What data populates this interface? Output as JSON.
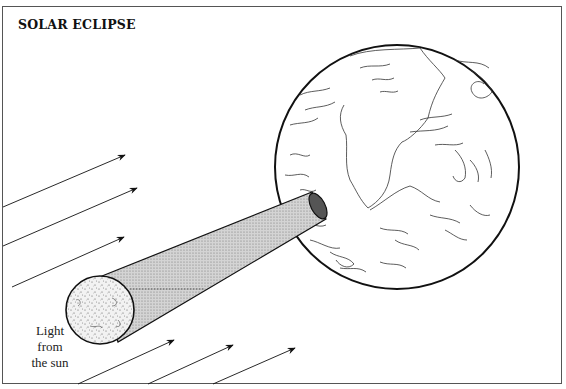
{
  "diagram": {
    "title": "SOLAR ECLIPSE",
    "label_lines": [
      "Light",
      "from",
      "the sun"
    ],
    "colors": {
      "ink": "#111111",
      "frame": "#555555",
      "shadow_fill": "#bdbdbd",
      "moon_fill": "#e6e6e6",
      "umbra_tip": "#555555",
      "background": "#ffffff"
    },
    "elements": {
      "earth": {
        "cx": 397,
        "cy": 167,
        "r": 122
      },
      "moon": {
        "cx": 100,
        "cy": 310,
        "r": 34
      },
      "shadow_cone": {
        "tip_cx": 317,
        "tip_cy": 206,
        "tip_rx": 7,
        "tip_ry": 14
      },
      "light_arrows": 6
    }
  }
}
